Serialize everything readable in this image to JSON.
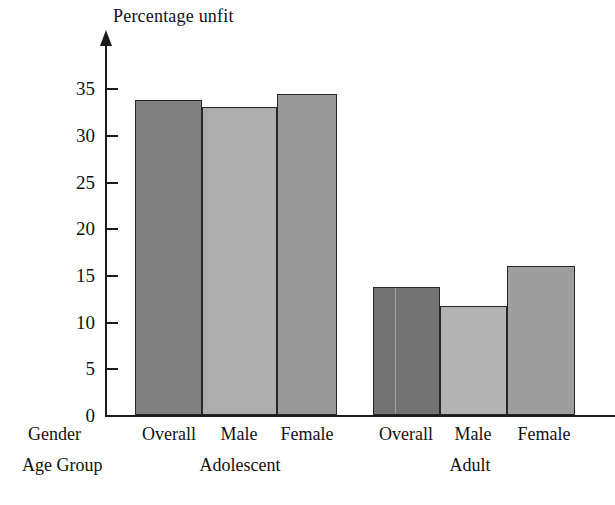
{
  "chart_data": {
    "type": "bar",
    "title": "",
    "ylabel": "Percentage unfit",
    "xlabel": "",
    "row_headers": [
      "Gender",
      "Age Group"
    ],
    "categories": [
      "Overall",
      "Male",
      "Female",
      "Overall",
      "Male",
      "Female"
    ],
    "groups": [
      {
        "label": "Adolescent",
        "categories": [
          "Overall",
          "Male",
          "Female"
        ],
        "values": [
          33.7,
          33.0,
          34.4
        ]
      },
      {
        "label": "Adult",
        "categories": [
          "Overall",
          "Male",
          "Female"
        ],
        "values": [
          13.7,
          11.7,
          16.0
        ]
      }
    ],
    "values": [
      33.7,
      33.0,
      34.4,
      13.7,
      11.7,
      16.0
    ],
    "ylim": [
      0,
      37
    ],
    "yticks": [
      0,
      5,
      10,
      15,
      20,
      25,
      30,
      35
    ],
    "ytick_labels": [
      "0",
      "5",
      "10",
      "15",
      "20",
      "25",
      "30",
      "35"
    ],
    "grid": false,
    "legend": "none",
    "bar_colors": [
      "#808080",
      "#adadad",
      "#999999",
      "#737373",
      "#b3b3b3",
      "#9e9e9e"
    ],
    "bar_edge_color": "#262626",
    "axis_color": "#1b1b1b",
    "background": "#ffffff"
  },
  "axis": {
    "title": "Percentage unfit",
    "arrow_icon": "up-arrow-icon"
  },
  "ticks": [
    {
      "value": "35"
    },
    {
      "value": "30"
    },
    {
      "value": "25"
    },
    {
      "value": "20"
    },
    {
      "value": "15"
    },
    {
      "value": "10"
    },
    {
      "value": "5"
    },
    {
      "value": "0"
    }
  ],
  "gender_labels": [
    {
      "label": "Overall"
    },
    {
      "label": "Male"
    },
    {
      "label": "Female"
    },
    {
      "label": "Overall"
    },
    {
      "label": "Male"
    },
    {
      "label": "Female"
    }
  ],
  "agegroup_labels": [
    {
      "label": "Adolescent"
    },
    {
      "label": "Adult"
    }
  ],
  "row_headers": {
    "gender": "Gender",
    "age_group": "Age Group"
  }
}
